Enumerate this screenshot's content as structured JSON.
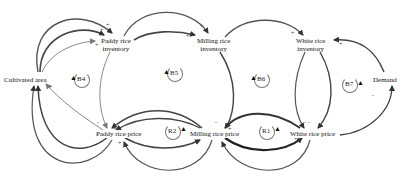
{
  "diagram": {
    "type": "causal-loop-diagram",
    "nodes": [
      {
        "id": "cultivated_area",
        "label": "Cultivated area",
        "x": 4,
        "y": 75
      },
      {
        "id": "paddy_inventory",
        "label_line1": "Paddy rice",
        "label_line2": "inventory",
        "x": 102,
        "y": 37
      },
      {
        "id": "milling_inventory",
        "label_line1": "Milling rice",
        "label_line2": "inventory",
        "x": 197,
        "y": 37
      },
      {
        "id": "white_inventory",
        "label_line1": "White rice",
        "label_line2": "inventory",
        "x": 297,
        "y": 37
      },
      {
        "id": "demand",
        "label": "Demand",
        "x": 374,
        "y": 75
      },
      {
        "id": "paddy_price",
        "label": "Paddy rice price",
        "x": 96,
        "y": 132
      },
      {
        "id": "milling_price",
        "label": "Milling rice price",
        "x": 190,
        "y": 132
      },
      {
        "id": "white_price",
        "label": "White rice price",
        "x": 288,
        "y": 132
      }
    ],
    "loops": [
      {
        "label": "B4",
        "x": 71,
        "y": 77
      },
      {
        "label": "B5",
        "x": 166,
        "y": 68
      },
      {
        "label": "B6",
        "x": 253,
        "y": 76
      },
      {
        "label": "B7",
        "x": 342,
        "y": 81
      },
      {
        "label": "R2",
        "x": 168,
        "y": 126
      },
      {
        "label": "R1",
        "x": 263,
        "y": 126
      }
    ],
    "signs": {
      "plus": "+",
      "minus": "-"
    }
  }
}
